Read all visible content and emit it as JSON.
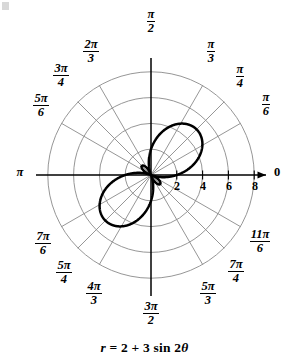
{
  "figure": {
    "caption_prefix": "r",
    "caption_body": " = 2 + 3 sin 2",
    "caption_theta": "θ",
    "caption_full": "r = 2 + 3 sin 2θ",
    "stroke_color": "#000000",
    "grid_color": "#8a8a8a",
    "axis_color": "#000000",
    "background": "#ffffff"
  },
  "chart_data": {
    "type": "line",
    "plot_kind": "polar",
    "title": "",
    "equation": "r = 2 + 3 sin 2θ",
    "equation_parts": {
      "r": "r",
      "a": 2,
      "b": 3,
      "trig": "sin",
      "multiple": 2,
      "variable": "θ"
    },
    "r_max_grid": 8,
    "r_ticks": [
      2,
      4,
      6,
      8
    ],
    "r_tick_labels": [
      "2",
      "4",
      "6",
      "8"
    ],
    "grid_circles": 4,
    "grid": true,
    "angular_gridlines_deg": [
      0,
      30,
      45,
      60,
      90,
      120,
      135,
      150,
      180,
      210,
      225,
      240,
      270,
      300,
      315,
      330
    ],
    "theta_labels": [
      {
        "text": "0",
        "type": "plain",
        "angle_deg": 0
      },
      {
        "text": "π/6",
        "num": "π",
        "den": "6",
        "type": "fraction",
        "angle_deg": 30
      },
      {
        "text": "π/4",
        "num": "π",
        "den": "4",
        "type": "fraction",
        "angle_deg": 45
      },
      {
        "text": "π/3",
        "num": "π",
        "den": "3",
        "type": "fraction",
        "angle_deg": 60
      },
      {
        "text": "π/2",
        "num": "π",
        "den": "2",
        "type": "fraction",
        "angle_deg": 90
      },
      {
        "text": "2π/3",
        "num": "2π",
        "den": "3",
        "type": "fraction",
        "angle_deg": 120
      },
      {
        "text": "3π/4",
        "num": "3π",
        "den": "4",
        "type": "fraction",
        "angle_deg": 135
      },
      {
        "text": "5π/6",
        "num": "5π",
        "den": "6",
        "type": "fraction",
        "angle_deg": 150
      },
      {
        "text": "π",
        "type": "plain",
        "angle_deg": 180
      },
      {
        "text": "7π/6",
        "num": "7π",
        "den": "6",
        "type": "fraction",
        "angle_deg": 210
      },
      {
        "text": "5π/4",
        "num": "5π",
        "den": "4",
        "type": "fraction",
        "angle_deg": 225
      },
      {
        "text": "4π/3",
        "num": "4π",
        "den": "3",
        "type": "fraction",
        "angle_deg": 240
      },
      {
        "text": "3π/2",
        "num": "3π",
        "den": "2",
        "type": "fraction",
        "angle_deg": 270
      },
      {
        "text": "5π/3",
        "num": "5π",
        "den": "3",
        "type": "fraction",
        "angle_deg": 300
      },
      {
        "text": "7π/4",
        "num": "7π",
        "den": "4",
        "type": "fraction",
        "angle_deg": 315
      },
      {
        "text": "11π/6",
        "num": "11π",
        "den": "6",
        "type": "fraction",
        "angle_deg": 330
      }
    ],
    "curve": {
      "name": "r = 2 + 3 sin 2θ",
      "r_min": -1,
      "r_max": 5,
      "petal_major_tip_r": 5,
      "petal_major_tip_theta_deg": 45,
      "petal_minor_tip_r": 5,
      "petal_minor_tip_theta_deg": 225,
      "inner_loop_max_r": 1,
      "inner_loop_theta_deg": 135,
      "zeros_theta_deg": [
        104.78,
        165.22,
        284.78,
        345.22
      ],
      "samples_theta_deg": [
        0,
        15,
        30,
        45,
        60,
        75,
        90,
        105,
        120,
        135,
        150,
        165,
        180,
        195,
        210,
        225,
        240,
        255,
        270,
        285,
        300,
        315,
        330,
        345
      ],
      "samples_r": [
        2.0,
        3.5,
        4.6,
        5.0,
        4.6,
        3.5,
        2.0,
        0.5,
        -0.6,
        -1.0,
        -0.6,
        0.5,
        2.0,
        3.5,
        4.6,
        5.0,
        4.6,
        3.5,
        2.0,
        0.5,
        -0.6,
        -1.0,
        -0.6,
        0.5
      ]
    },
    "axis_arrows": [
      "polar-axis-right"
    ],
    "legend": null,
    "legend_position": "none"
  }
}
